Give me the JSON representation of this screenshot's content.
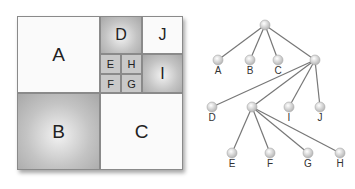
{
  "treemap": {
    "cells": [
      {
        "id": "A",
        "label": "A"
      },
      {
        "id": "B",
        "label": "B"
      },
      {
        "id": "C",
        "label": "C"
      },
      {
        "id": "D",
        "label": "D"
      },
      {
        "id": "E",
        "label": "E"
      },
      {
        "id": "F",
        "label": "F"
      },
      {
        "id": "G",
        "label": "G"
      },
      {
        "id": "H",
        "label": "H"
      },
      {
        "id": "I",
        "label": "I"
      },
      {
        "id": "J",
        "label": "J"
      }
    ]
  },
  "tree": {
    "labels": {
      "A": "A",
      "B": "B",
      "C": "C",
      "D": "D",
      "E": "E",
      "F": "F",
      "G": "G",
      "H": "H",
      "I": "I",
      "J": "J"
    }
  }
}
